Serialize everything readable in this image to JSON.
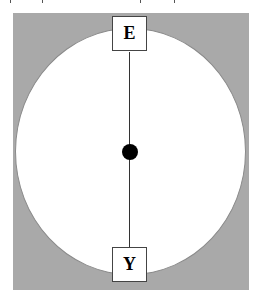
{
  "diagram": {
    "nodes": [
      {
        "id": "top",
        "label": "E",
        "position": "top"
      },
      {
        "id": "bottom",
        "label": "Y",
        "position": "bottom"
      }
    ],
    "edges": [
      {
        "from": "top",
        "to": "bottom",
        "style": "line"
      }
    ],
    "center_marker": "filled-dot",
    "shapes": {
      "background": {
        "type": "rectangle",
        "color": "#a9a9a9"
      },
      "region": {
        "type": "ellipse",
        "color": "#ffffff"
      }
    }
  }
}
